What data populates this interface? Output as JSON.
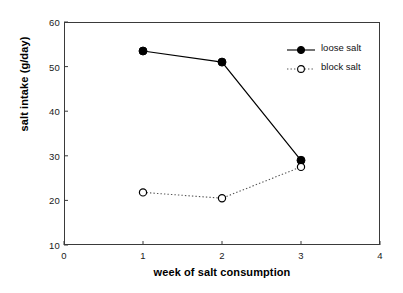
{
  "chart_data": {
    "type": "line",
    "title": "",
    "xlabel": "week of salt consumption",
    "ylabel": "salt intake (g/day)",
    "x": [
      1,
      2,
      3
    ],
    "xlim": [
      0,
      4
    ],
    "ylim": [
      10,
      60
    ],
    "xticks": [
      "0",
      "1",
      "2",
      "3",
      "4"
    ],
    "yticks": [
      "10",
      "20",
      "30",
      "40",
      "50",
      "60"
    ],
    "grid": false,
    "legend_position": "upper right",
    "series": [
      {
        "name": "loose salt",
        "values": [
          53.5,
          51.0,
          29.0
        ],
        "marker": "filled-circle",
        "linestyle": "solid",
        "color": "#000000"
      },
      {
        "name": "block salt",
        "values": [
          21.8,
          20.5,
          27.5
        ],
        "marker": "open-circle",
        "linestyle": "dotted",
        "color": "#000000"
      }
    ]
  },
  "legend": {
    "entries": [
      {
        "label": "loose salt"
      },
      {
        "label": "block salt"
      }
    ]
  },
  "axes": {
    "x_title": "week of salt consumption",
    "y_title": "salt intake (g/day)",
    "x_tick_labels": [
      "0",
      "1",
      "2",
      "3",
      "4"
    ],
    "y_tick_labels": [
      "10",
      "20",
      "30",
      "40",
      "50",
      "60"
    ]
  },
  "colors": {
    "ink": "#000000",
    "frame": "#3a3a3a",
    "background": "#ffffff"
  }
}
